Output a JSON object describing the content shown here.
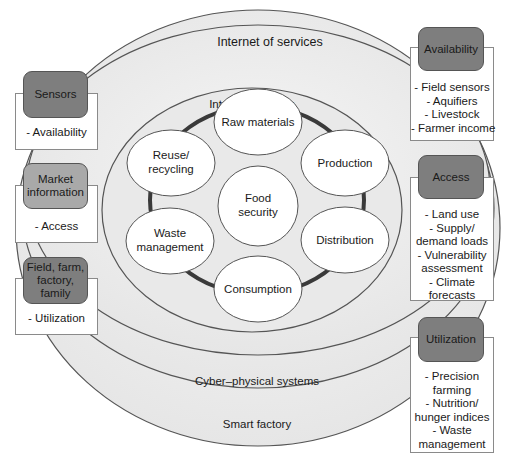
{
  "rings": {
    "outer_label": "Smart factory",
    "cyber_label": "Cyber–physical systems",
    "services_label": "Internet of services",
    "things_label": "Internet of things"
  },
  "center": {
    "line1": "Food",
    "line2": "security"
  },
  "cycle_nodes": [
    {
      "lines": [
        "Raw materials"
      ]
    },
    {
      "lines": [
        "Production"
      ]
    },
    {
      "lines": [
        "Distribution"
      ]
    },
    {
      "lines": [
        "Consumption"
      ]
    },
    {
      "lines": [
        "Waste",
        "management"
      ]
    },
    {
      "lines": [
        "Reuse/",
        "recycling"
      ]
    }
  ],
  "left_boxes": [
    {
      "header": [
        "Sensors"
      ],
      "items": [
        "- Availability"
      ]
    },
    {
      "header": [
        "Market",
        "information"
      ],
      "items": [
        "- Access"
      ]
    },
    {
      "header": [
        "Field, farm,",
        "factory,",
        "family"
      ],
      "items": [
        "- Utilization"
      ]
    }
  ],
  "right_boxes": [
    {
      "header": [
        "Availability"
      ],
      "items": [
        "- Field sensors",
        "- Aquifiers",
        "- Livestock",
        "- Farmer income"
      ]
    },
    {
      "header": [
        "Access"
      ],
      "items": [
        "- Land use",
        "- Supply/",
        "demand loads",
        "- Vulnerability",
        "assessment",
        "- Climate",
        "forecasts"
      ]
    },
    {
      "header": [
        "Utilization"
      ],
      "items": [
        "- Precision",
        "farming",
        "- Nutrition/",
        "hunger indices",
        "- Waste",
        "management"
      ]
    }
  ],
  "colors": {
    "ring_fill": "#ececec",
    "ring_stroke": "#555555",
    "node_fill": "#ffffff",
    "connector": "#3a3a3a",
    "header_dark": "#7e7e7e",
    "header_light": "#a9a9a9"
  }
}
